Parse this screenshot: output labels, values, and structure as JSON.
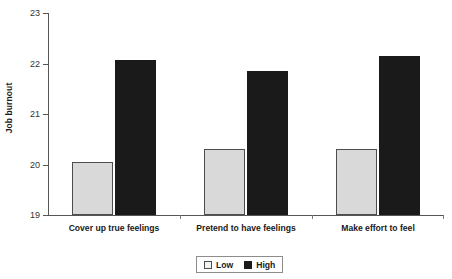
{
  "chart_data": {
    "type": "bar",
    "title": "",
    "xlabel": "",
    "ylabel": "Job burnout",
    "ylim": [
      19,
      23
    ],
    "yticks": [
      19,
      20,
      21,
      22,
      23
    ],
    "ytick_labels": [
      "19",
      "20",
      "21",
      "22",
      "23"
    ],
    "grid": false,
    "legend_position": "bottom-center",
    "categories": [
      "Cover up true feelings",
      "Pretend to have feelings",
      "Make effort to feel"
    ],
    "series": [
      {
        "name": "Low",
        "color": "#d9d9d9",
        "values": [
          20.05,
          20.3,
          20.3
        ]
      },
      {
        "name": "High",
        "color": "#1a1a1a",
        "values": [
          22.07,
          21.85,
          22.15
        ]
      }
    ]
  },
  "legend": {
    "items": [
      {
        "label": "Low"
      },
      {
        "label": "High"
      }
    ]
  }
}
